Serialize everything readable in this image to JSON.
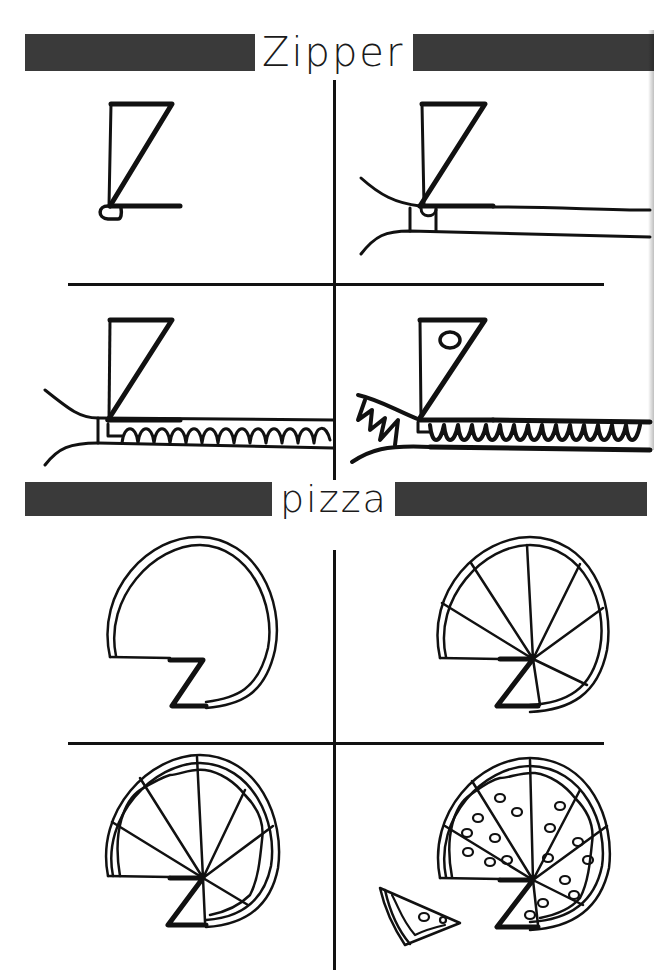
{
  "page": {
    "sections": [
      {
        "id": "zipper",
        "heading": "Zipper",
        "steps": [
          {
            "step": 1,
            "description": "Draw Z shape with small pull loop"
          },
          {
            "step": 2,
            "description": "Add zipper tape lines and slider"
          },
          {
            "step": 3,
            "description": "Add interlocking teeth"
          },
          {
            "step": 4,
            "description": "Add hole in pull tab and open teeth"
          }
        ]
      },
      {
        "id": "pizza",
        "heading": "pizza",
        "steps": [
          {
            "step": 1,
            "description": "Draw Z with crust circle"
          },
          {
            "step": 2,
            "description": "Add slice lines"
          },
          {
            "step": 3,
            "description": "Add wavy cheese edge"
          },
          {
            "step": 4,
            "description": "Add pepperoni and a separate slice"
          }
        ]
      }
    ],
    "colors": {
      "ink": "#111111",
      "header_bar": "#3a3a3a",
      "paper": "#ffffff"
    }
  }
}
